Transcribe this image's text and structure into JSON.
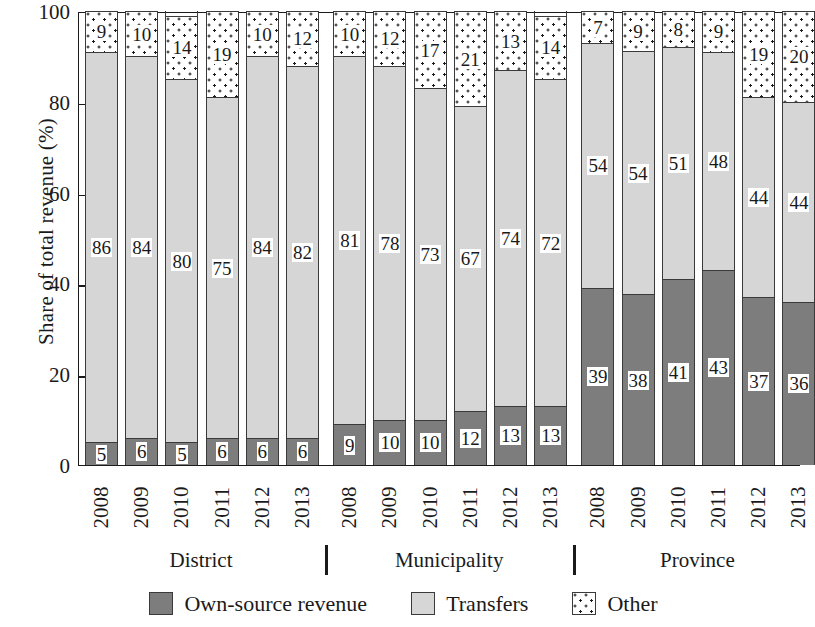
{
  "chart_data": {
    "type": "bar",
    "subtype": "stacked-bar-100-percent",
    "title": "",
    "xlabel": "",
    "ylabel": "Share of total revenue (%)",
    "ylim": [
      0,
      100
    ],
    "yticks": [
      0,
      20,
      40,
      60,
      80,
      100
    ],
    "grid": false,
    "legend_position": "bottom",
    "categories": [
      "2008",
      "2009",
      "2010",
      "2011",
      "2012",
      "2013",
      "2008",
      "2009",
      "2010",
      "2011",
      "2012",
      "2013",
      "2008",
      "2009",
      "2010",
      "2011",
      "2012",
      "2013"
    ],
    "groups": [
      {
        "label": "District",
        "years": [
          "2008",
          "2009",
          "2010",
          "2011",
          "2012",
          "2013"
        ]
      },
      {
        "label": "Municipality",
        "years": [
          "2008",
          "2009",
          "2010",
          "2011",
          "2012",
          "2013"
        ]
      },
      {
        "label": "Province",
        "years": [
          "2008",
          "2009",
          "2010",
          "2011",
          "2012",
          "2013"
        ]
      }
    ],
    "series": [
      {
        "name": "Own-source revenue",
        "color": "#7d7d7d",
        "values": [
          5,
          6,
          5,
          6,
          6,
          6,
          9,
          10,
          10,
          12,
          13,
          13,
          39,
          38,
          41,
          43,
          37,
          36
        ]
      },
      {
        "name": "Transfers",
        "color": "#d6d6d6",
        "values": [
          86,
          84,
          80,
          75,
          84,
          82,
          81,
          78,
          73,
          67,
          74,
          72,
          54,
          54,
          51,
          48,
          44,
          44
        ]
      },
      {
        "name": "Other",
        "color": "#ffffff",
        "values": [
          9,
          10,
          14,
          19,
          10,
          12,
          10,
          12,
          17,
          21,
          13,
          14,
          7,
          9,
          8,
          9,
          19,
          20
        ]
      }
    ]
  },
  "legend": {
    "items": [
      {
        "label": "Own-source revenue",
        "swatch": "own"
      },
      {
        "label": "Transfers",
        "swatch": "tr"
      },
      {
        "label": "Other",
        "swatch": "oth"
      }
    ]
  },
  "axis": {
    "y_title": "Share of total revenue (%)",
    "y_ticks": [
      "100",
      "80",
      "60",
      "40",
      "20",
      "0"
    ]
  }
}
